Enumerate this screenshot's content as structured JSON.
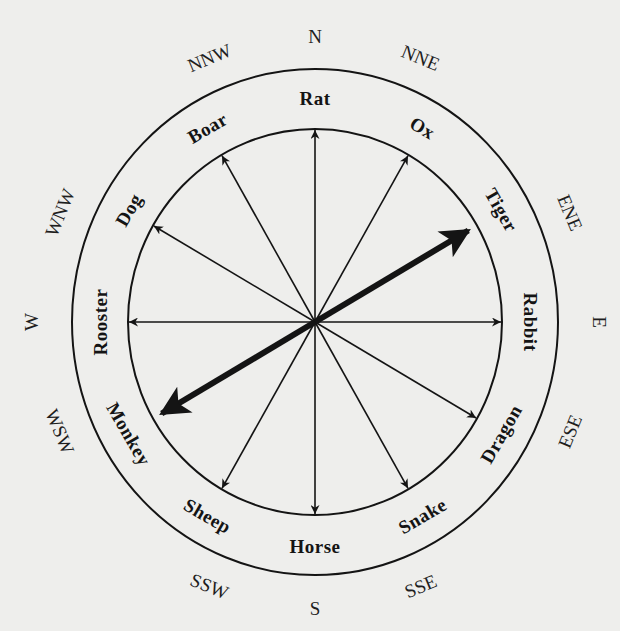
{
  "diagram": {
    "center": {
      "x": 315,
      "y": 322
    },
    "outer_ring": {
      "rx": 243,
      "ry": 253
    },
    "inner_ring": {
      "rx": 187,
      "ry": 193
    },
    "compass_radius": {
      "rx": 276,
      "ry": 286
    },
    "animal_radius": {
      "rx": 215,
      "ry": 224
    },
    "ink_color": "#141414",
    "background_color": "#eeeeec",
    "compass_points": [
      {
        "label": "N",
        "angle": 0
      },
      {
        "label": "NNE",
        "angle": 22.5
      },
      {
        "label": "ENE",
        "angle": 67.5
      },
      {
        "label": "E",
        "angle": 90
      },
      {
        "label": "ESE",
        "angle": 112.5
      },
      {
        "label": "SSE",
        "angle": 157.5
      },
      {
        "label": "S",
        "angle": 180
      },
      {
        "label": "SSW",
        "angle": 202.5
      },
      {
        "label": "WSW",
        "angle": 247.5
      },
      {
        "label": "W",
        "angle": 270
      },
      {
        "label": "WNW",
        "angle": 292.5
      },
      {
        "label": "NNW",
        "angle": 337.5
      }
    ],
    "animals": [
      {
        "label": "Rat",
        "angle": 0
      },
      {
        "label": "Ox",
        "angle": 30
      },
      {
        "label": "Tiger",
        "angle": 60
      },
      {
        "label": "Rabbit",
        "angle": 90
      },
      {
        "label": "Dragon",
        "angle": 120
      },
      {
        "label": "Snake",
        "angle": 150
      },
      {
        "label": "Horse",
        "angle": 180
      },
      {
        "label": "Sheep",
        "angle": 210
      },
      {
        "label": "Monkey",
        "angle": 240
      },
      {
        "label": "Rooster",
        "angle": 270
      },
      {
        "label": "Dog",
        "angle": 300
      },
      {
        "label": "Boar",
        "angle": 330
      }
    ],
    "thin_arrows": [
      0,
      30,
      90,
      120,
      150,
      180,
      210,
      270,
      300,
      330
    ],
    "thick_axis": {
      "from_angle": 240,
      "to_angle": 60
    }
  }
}
